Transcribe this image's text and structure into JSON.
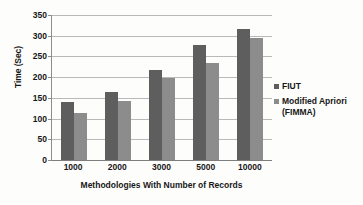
{
  "chart_data": {
    "type": "bar",
    "title": "",
    "xlabel": "Methodologies With Number of Records",
    "ylabel": "Time (Sec)",
    "categories": [
      "1000",
      "2000",
      "3000",
      "5000",
      "10000"
    ],
    "series": [
      {
        "name": "FIUT",
        "color": "#5e5e5e",
        "values": [
          140,
          164,
          218,
          278,
          317
        ]
      },
      {
        "name": "Modified Apriori (FIMMA)",
        "color": "#8c8c8c",
        "values": [
          113,
          143,
          197,
          234,
          294
        ]
      }
    ],
    "ylim": [
      0,
      350
    ],
    "yticks": [
      "0",
      "50",
      "100",
      "150",
      "200",
      "250",
      "300",
      "350"
    ],
    "ytick_values": [
      0,
      50,
      100,
      150,
      200,
      250,
      300,
      350
    ],
    "grid": "horizontal",
    "legend_position": "right"
  },
  "legend": {
    "entries": [
      {
        "label": "FIUT"
      },
      {
        "label": "Modified Apriori\n(FIMMA)"
      }
    ]
  }
}
